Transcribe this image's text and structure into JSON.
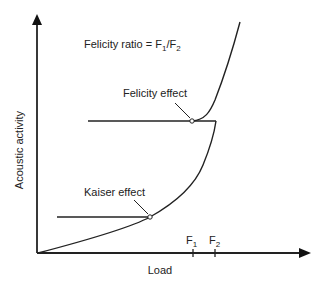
{
  "diagram": {
    "title_formula": {
      "prefix": "Felicity ratio = F",
      "sub1": "1",
      "slash": "/F",
      "sub2": "2"
    },
    "axes": {
      "y_label": "Acoustic activity",
      "x_label": "Load"
    },
    "annotations": {
      "felicity": "Felicity effect",
      "kaiser": "Kaiser effect"
    },
    "ticks": [
      {
        "base": "F",
        "sub": "1"
      },
      {
        "base": "F",
        "sub": "2"
      }
    ],
    "colors": {
      "line": "#222222",
      "background": "#ffffff"
    }
  }
}
